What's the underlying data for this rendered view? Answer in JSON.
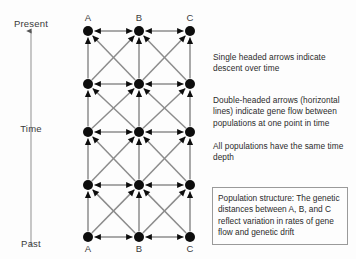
{
  "diagram": {
    "title_visible": false,
    "time_axis": {
      "top_label": "Present",
      "middle_label": "Time",
      "bottom_label": "Past",
      "arrow_direction": "up",
      "arrow_color": "#8a8a8a"
    },
    "columns": [
      {
        "id": "A",
        "top_label": "A",
        "bottom_label": "A",
        "x": 28
      },
      {
        "id": "B",
        "top_label": "B",
        "bottom_label": "B",
        "x": 79
      },
      {
        "id": "C",
        "top_label": "C",
        "bottom_label": "C",
        "x": 130
      }
    ],
    "rows": [
      {
        "index": 0,
        "y": 25,
        "time": "Present"
      },
      {
        "index": 1,
        "y": 78,
        "time": ""
      },
      {
        "index": 2,
        "y": 126,
        "time": ""
      },
      {
        "index": 3,
        "y": 179,
        "time": ""
      },
      {
        "index": 4,
        "y": 231,
        "time": "Past"
      }
    ],
    "node_count": 15,
    "node_color": "#0d0d0d",
    "node_radius": 5,
    "edge_color": "#8c8c8c",
    "arrowhead_color": "#0d0d0d",
    "vertical_edges": "single-headed arrows pointing up (toward Present)",
    "diagonal_edges": "single-headed arrows pointing up between adjacent columns",
    "horizontal_edges": "double-headed arrows within each time row"
  },
  "notes": {
    "note_1": "Single headed arrows indicate descent over time",
    "note_2": "Double-headed arrows (horizontal lines) indicate gene flow between populations at one point in time",
    "note_3": "All populations have the same time depth",
    "note_box": "Population structure: The genetic distances between A, B, and C reflect variation in rates of gene flow and genetic drift"
  }
}
